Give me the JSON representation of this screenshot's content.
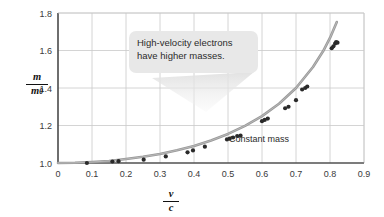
{
  "figure": {
    "background": "#ffffff",
    "axis_color": "#4a4a4a",
    "grid_color": "#c9c9c9",
    "curve_color": "#9a9a9a",
    "point_color": "#2a2a2a",
    "callout_fill": "#e8e8e8"
  },
  "ylabel": {
    "numerator": "m",
    "denominator": "m",
    "denominator_sub": "0"
  },
  "xlabel": {
    "numerator": "v",
    "denominator": "c"
  },
  "annotations": {
    "callout_line1": "High-velocity electrons",
    "callout_line2": "have higher masses.",
    "constant_mass": "Constant mass"
  },
  "chart_data": {
    "type": "scatter",
    "title": "",
    "xlabel": "v/c",
    "ylabel": "m/m0",
    "xlim": [
      0,
      0.9
    ],
    "ylim": [
      1.0,
      1.8
    ],
    "xticks": [
      0,
      0.1,
      0.2,
      0.3,
      0.4,
      0.5,
      0.6,
      0.7,
      0.8,
      0.9
    ],
    "xticklabels": [
      "0",
      "0.1",
      "0.2",
      "0.3",
      "0.4",
      "0.5",
      "0.6",
      "0.7",
      "0.8",
      "0.9"
    ],
    "yticks": [
      1.0,
      1.2,
      1.4,
      1.6,
      1.8
    ],
    "yticklabels": [
      "1.0",
      "1.2",
      "1.4",
      "1.6",
      "1.8"
    ],
    "grid": true,
    "legend": "none",
    "series": [
      {
        "name": "Measured electron mass",
        "type": "scatter",
        "marker": "circle",
        "color": "#2a2a2a",
        "points": [
          [
            0.085,
            1.0
          ],
          [
            0.16,
            1.008
          ],
          [
            0.178,
            1.01
          ],
          [
            0.252,
            1.018
          ],
          [
            0.317,
            1.035
          ],
          [
            0.381,
            1.057
          ],
          [
            0.397,
            1.067
          ],
          [
            0.432,
            1.087
          ],
          [
            0.497,
            1.126
          ],
          [
            0.505,
            1.13
          ],
          [
            0.515,
            1.136
          ],
          [
            0.527,
            1.144
          ],
          [
            0.537,
            1.146
          ],
          [
            0.6,
            1.223
          ],
          [
            0.608,
            1.23
          ],
          [
            0.617,
            1.237
          ],
          [
            0.668,
            1.292
          ],
          [
            0.678,
            1.3
          ],
          [
            0.7,
            1.335
          ],
          [
            0.718,
            1.392
          ],
          [
            0.727,
            1.4
          ],
          [
            0.733,
            1.408
          ],
          [
            0.805,
            1.612
          ],
          [
            0.81,
            1.622
          ],
          [
            0.815,
            1.637
          ],
          [
            0.818,
            1.645
          ],
          [
            0.822,
            1.642
          ]
        ]
      },
      {
        "name": "Relativistic prediction",
        "type": "line",
        "color": "#9a9a9a",
        "x": [
          0.0,
          0.05,
          0.1,
          0.15,
          0.2,
          0.25,
          0.3,
          0.35,
          0.4,
          0.45,
          0.5,
          0.55,
          0.6,
          0.65,
          0.7,
          0.75,
          0.78,
          0.8,
          0.82,
          0.835
        ],
        "y": [
          1.0,
          1.001,
          1.005,
          1.011,
          1.021,
          1.033,
          1.048,
          1.068,
          1.091,
          1.12,
          1.155,
          1.198,
          1.25,
          1.316,
          1.4,
          1.512,
          1.597,
          1.667,
          1.752,
          1.82
        ]
      },
      {
        "name": "Constant mass reference",
        "type": "line",
        "color": "#555555",
        "x": [
          0.0,
          0.9
        ],
        "y": [
          1.0,
          1.0
        ]
      }
    ]
  }
}
